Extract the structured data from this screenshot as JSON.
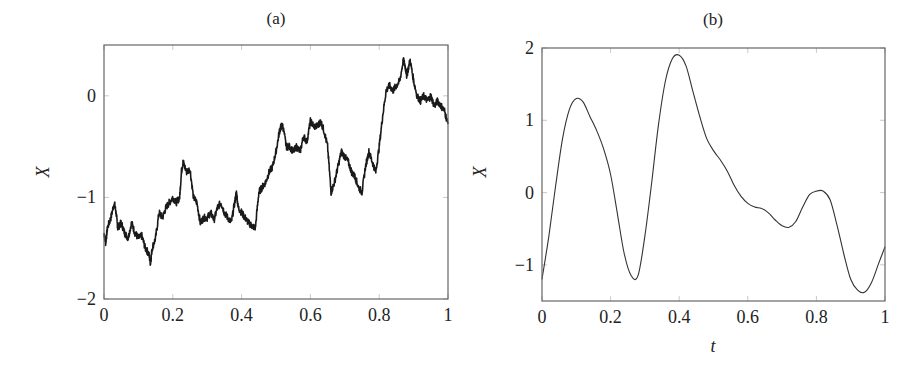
{
  "chart_data": [
    {
      "type": "line",
      "title": "(a)",
      "xlabel": "",
      "ylabel": "X",
      "xlim": [
        0,
        1
      ],
      "ylim": [
        -2,
        0.5
      ],
      "xticks": [
        "0",
        "0.2",
        "0.4",
        "0.6",
        "0.8",
        "1"
      ],
      "yticks": [
        "0",
        "−1",
        "−2"
      ],
      "ytick_values": [
        0,
        -1,
        -2
      ],
      "xtick_values": [
        0,
        0.2,
        0.4,
        0.6,
        0.8,
        1
      ],
      "grid": false,
      "legend": null,
      "series": [
        {
          "name": "Brownian path",
          "x": [
            0,
            0.005,
            0.01,
            0.02,
            0.03,
            0.035,
            0.04,
            0.05,
            0.06,
            0.07,
            0.08,
            0.09,
            0.1,
            0.11,
            0.12,
            0.13,
            0.135,
            0.14,
            0.15,
            0.16,
            0.17,
            0.18,
            0.19,
            0.2,
            0.21,
            0.22,
            0.225,
            0.23,
            0.24,
            0.25,
            0.26,
            0.27,
            0.28,
            0.29,
            0.3,
            0.31,
            0.32,
            0.33,
            0.34,
            0.35,
            0.36,
            0.37,
            0.38,
            0.385,
            0.39,
            0.4,
            0.41,
            0.42,
            0.43,
            0.44,
            0.45,
            0.46,
            0.47,
            0.48,
            0.49,
            0.5,
            0.51,
            0.515,
            0.52,
            0.53,
            0.54,
            0.55,
            0.56,
            0.57,
            0.58,
            0.59,
            0.6,
            0.61,
            0.62,
            0.63,
            0.64,
            0.65,
            0.66,
            0.67,
            0.68,
            0.69,
            0.7,
            0.71,
            0.72,
            0.73,
            0.74,
            0.75,
            0.76,
            0.77,
            0.78,
            0.79,
            0.8,
            0.81,
            0.82,
            0.83,
            0.84,
            0.85,
            0.86,
            0.87,
            0.875,
            0.88,
            0.89,
            0.9,
            0.91,
            0.92,
            0.93,
            0.94,
            0.95,
            0.96,
            0.97,
            0.98,
            0.99,
            1.0
          ],
          "y": [
            -1.35,
            -1.45,
            -1.3,
            -1.2,
            -1.05,
            -1.15,
            -1.3,
            -1.25,
            -1.35,
            -1.4,
            -1.25,
            -1.35,
            -1.4,
            -1.38,
            -1.5,
            -1.55,
            -1.65,
            -1.5,
            -1.4,
            -1.15,
            -1.2,
            -1.1,
            -1.05,
            -1.0,
            -1.05,
            -1.0,
            -0.75,
            -0.65,
            -0.75,
            -0.72,
            -1.0,
            -1.05,
            -1.25,
            -1.2,
            -1.2,
            -1.15,
            -1.22,
            -1.1,
            -1.05,
            -1.15,
            -1.2,
            -1.25,
            -1.05,
            -0.95,
            -1.1,
            -1.15,
            -1.2,
            -1.25,
            -1.28,
            -1.3,
            -0.95,
            -0.9,
            -0.85,
            -0.75,
            -0.7,
            -0.55,
            -0.35,
            -0.3,
            -0.3,
            -0.5,
            -0.5,
            -0.55,
            -0.5,
            -0.55,
            -0.4,
            -0.45,
            -0.25,
            -0.3,
            -0.3,
            -0.25,
            -0.35,
            -0.5,
            -0.95,
            -0.85,
            -0.7,
            -0.55,
            -0.6,
            -0.65,
            -0.75,
            -0.8,
            -0.9,
            -0.95,
            -0.7,
            -0.55,
            -0.65,
            -0.75,
            -0.5,
            -0.2,
            0.05,
            0.1,
            0.05,
            0.1,
            0.15,
            0.35,
            0.3,
            0.2,
            0.35,
            0.15,
            0.0,
            -0.05,
            0.0,
            -0.05,
            0.0,
            -0.1,
            -0.05,
            -0.1,
            -0.15,
            -0.28
          ]
        }
      ]
    },
    {
      "type": "line",
      "title": "(b)",
      "xlabel": "t",
      "ylabel": "X",
      "xlim": [
        0,
        1
      ],
      "ylim": [
        -1.5,
        2
      ],
      "xticks": [
        "0",
        "0.2",
        "0.4",
        "0.6",
        "0.8",
        "1"
      ],
      "yticks": [
        "2",
        "1",
        "0",
        "−1"
      ],
      "ytick_values": [
        2,
        1,
        0,
        -1
      ],
      "xtick_values": [
        0,
        0.2,
        0.4,
        0.6,
        0.8,
        1
      ],
      "grid": false,
      "legend": null,
      "series": [
        {
          "name": "smooth path",
          "x": [
            0,
            0.02,
            0.04,
            0.06,
            0.08,
            0.1,
            0.12,
            0.14,
            0.16,
            0.18,
            0.2,
            0.22,
            0.24,
            0.26,
            0.28,
            0.3,
            0.32,
            0.34,
            0.36,
            0.38,
            0.4,
            0.42,
            0.44,
            0.46,
            0.48,
            0.5,
            0.52,
            0.54,
            0.56,
            0.58,
            0.6,
            0.62,
            0.64,
            0.66,
            0.68,
            0.7,
            0.72,
            0.74,
            0.76,
            0.78,
            0.8,
            0.82,
            0.84,
            0.86,
            0.88,
            0.9,
            0.92,
            0.94,
            0.96,
            0.98,
            1.0
          ],
          "y": [
            -1.2,
            -0.6,
            0.1,
            0.75,
            1.15,
            1.3,
            1.25,
            1.05,
            0.85,
            0.6,
            0.25,
            -0.3,
            -0.85,
            -1.15,
            -1.15,
            -0.6,
            0.15,
            0.95,
            1.55,
            1.85,
            1.9,
            1.75,
            1.4,
            1.05,
            0.75,
            0.58,
            0.45,
            0.3,
            0.1,
            -0.05,
            -0.15,
            -0.2,
            -0.22,
            -0.28,
            -0.38,
            -0.46,
            -0.48,
            -0.4,
            -0.2,
            -0.03,
            0.02,
            0.02,
            -0.1,
            -0.45,
            -0.85,
            -1.2,
            -1.35,
            -1.38,
            -1.25,
            -1.0,
            -0.75
          ]
        }
      ]
    }
  ]
}
